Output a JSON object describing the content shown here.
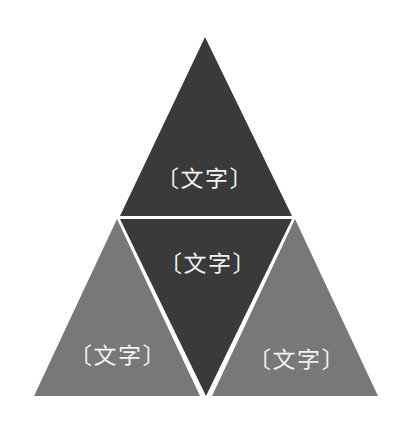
{
  "canvas": {
    "width": 409,
    "height": 431,
    "background_color": "#ffffff"
  },
  "diagram": {
    "type": "pyramid",
    "title": "",
    "segment_count": 4,
    "colors": {
      "dark_fill": "#3a3a3a",
      "light_fill": "#787878",
      "divider": "#ffffff",
      "label_text": "#f2f2f2"
    },
    "geometry": {
      "apex": [
        205,
        37
      ],
      "bottom_left": [
        34,
        396
      ],
      "bottom_right": [
        378,
        396
      ],
      "midline_left": [
        120,
        216
      ],
      "midline_right": [
        292,
        216
      ],
      "inner_bottom": [
        206,
        396
      ]
    },
    "segments": [
      {
        "id": "top",
        "label": "〔文字〕",
        "fill": "#3a3a3a",
        "shape": "triangle-up",
        "points": "205,37 292,216 120,216"
      },
      {
        "id": "middle",
        "label": "〔文字〕",
        "fill": "#3a3a3a",
        "shape": "triangle-down",
        "points": "120,219 292,219 206,396"
      },
      {
        "id": "bottom-left",
        "label": "〔文字〕",
        "fill": "#787878",
        "shape": "triangle-left",
        "points": "117,219 34,396 200,396"
      },
      {
        "id": "bottom-right",
        "label": "〔文字〕",
        "fill": "#787878",
        "shape": "triangle-right",
        "points": "295,219 212,396 378,396"
      }
    ]
  }
}
